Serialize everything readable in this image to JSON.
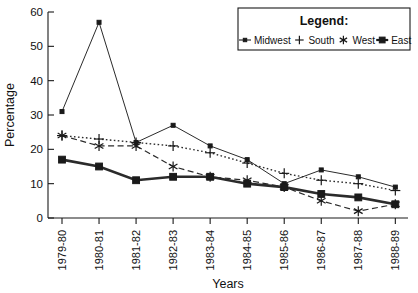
{
  "chart_data": {
    "type": "line",
    "title": "",
    "xlabel": "Years",
    "ylabel": "Percentage",
    "ylim": [
      0,
      60
    ],
    "yticks": [
      0,
      10,
      20,
      30,
      40,
      50,
      60
    ],
    "grid": false,
    "legend_position": "top-right",
    "legend_title": "Legend:",
    "categories": [
      "1979-80",
      "1980-81",
      "1981-82",
      "1982-83",
      "1983-84",
      "1984-85",
      "1985-86",
      "1986-87",
      "1987-88",
      "1988-89"
    ],
    "series": [
      {
        "name": "Midwest",
        "marker": "small-square",
        "line_style": "solid",
        "values": [
          31,
          57,
          22,
          27,
          21,
          17,
          10,
          14,
          12,
          9
        ]
      },
      {
        "name": "South",
        "marker": "plus",
        "line_style": "dotted",
        "values": [
          24,
          23,
          22,
          21,
          19,
          16,
          13,
          11,
          10,
          8
        ]
      },
      {
        "name": "West",
        "marker": "asterisk",
        "line_style": "dashed",
        "values": [
          24,
          21,
          21,
          15,
          12,
          11,
          9,
          5,
          2,
          4
        ]
      },
      {
        "name": "East",
        "marker": "filled-square",
        "line_style": "solid-thick",
        "values": [
          17,
          15,
          11,
          12,
          12,
          10,
          9,
          7,
          6,
          4
        ]
      }
    ]
  },
  "axes": {
    "y_title": "Percentage",
    "x_title": "Years"
  }
}
